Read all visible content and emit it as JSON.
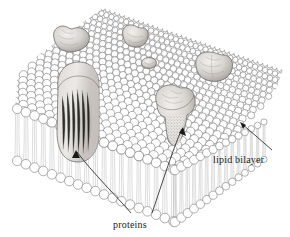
{
  "figure": {
    "type": "biological-diagram",
    "background_color": "#ffffff",
    "ink_color": "#3a3a3a",
    "shade_color": "#9a9a9a"
  },
  "labels": {
    "bilayer": "lipid bilayer",
    "proteins": "proteins"
  },
  "annotations": [
    {
      "name": "lipid-bilayer-leader",
      "text": "lipid bilayer",
      "arrow_from": [
        272,
        150
      ],
      "arrow_to": [
        240,
        122
      ]
    },
    {
      "name": "proteins-leader-left",
      "text": "proteins",
      "arrow_from": [
        131,
        214
      ],
      "arrow_to": [
        76,
        150
      ]
    },
    {
      "name": "proteins-leader-right",
      "text": "proteins",
      "arrow_from": [
        152,
        214
      ],
      "arrow_to": [
        183,
        127
      ]
    }
  ],
  "structure": {
    "top_face_label": "outer leaflet head groups",
    "front_face_label": "cut face of bilayer",
    "right_face_label": "cut face of bilayer",
    "head_group_shape": "circle",
    "tail_shape": "hair-line",
    "packing": "hexagonal"
  },
  "proteins": [
    {
      "name": "protein-top-left",
      "cx": 72,
      "cy": 40,
      "rx": 17,
      "ry": 11,
      "kind": "peripheral-lobed"
    },
    {
      "name": "protein-top-mid",
      "cx": 134,
      "cy": 36,
      "rx": 12,
      "ry": 10,
      "kind": "peripheral-lobed"
    },
    {
      "name": "protein-small-mid",
      "cx": 149,
      "cy": 63,
      "rx": 7,
      "ry": 5,
      "kind": "small-embedded"
    },
    {
      "name": "protein-right",
      "cx": 213,
      "cy": 67,
      "rx": 17,
      "ry": 12,
      "kind": "embedded-rounded"
    },
    {
      "name": "protein-large-left",
      "cx": 78,
      "cy": 113,
      "rx": 21,
      "ry": 42,
      "kind": "transmembrane"
    },
    {
      "name": "protein-center",
      "cx": 176,
      "cy": 106,
      "rx": 19,
      "ry": 14,
      "kind": "transmembrane-lobed"
    }
  ]
}
